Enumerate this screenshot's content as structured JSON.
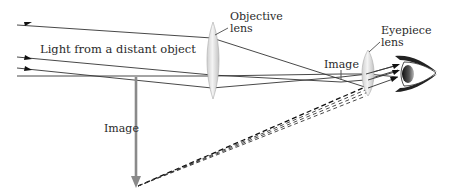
{
  "diagram": {
    "type": "optics-ray-diagram",
    "labels": {
      "light_source": "Light from a distant object",
      "objective_line1": "Objective",
      "objective_line2": "lens",
      "eyepiece_line1": "Eyepiece",
      "eyepiece_line2": "lens",
      "intermediate_image": "Image",
      "final_image": "Image"
    },
    "components": [
      {
        "id": "objective-lens",
        "kind": "converging lens"
      },
      {
        "id": "intermediate-image",
        "kind": "real image arrow"
      },
      {
        "id": "eyepiece-lens",
        "kind": "converging lens"
      },
      {
        "id": "eye",
        "kind": "observer eye"
      },
      {
        "id": "final-image",
        "kind": "virtual image arrow (inverted, enlarged)"
      }
    ],
    "colors": {
      "ray": "#333333",
      "image_arrow": "#8a8a8a",
      "lens_fill": "#e4e4e4",
      "dashed": "#444444",
      "text": "#2a2a2a"
    }
  }
}
